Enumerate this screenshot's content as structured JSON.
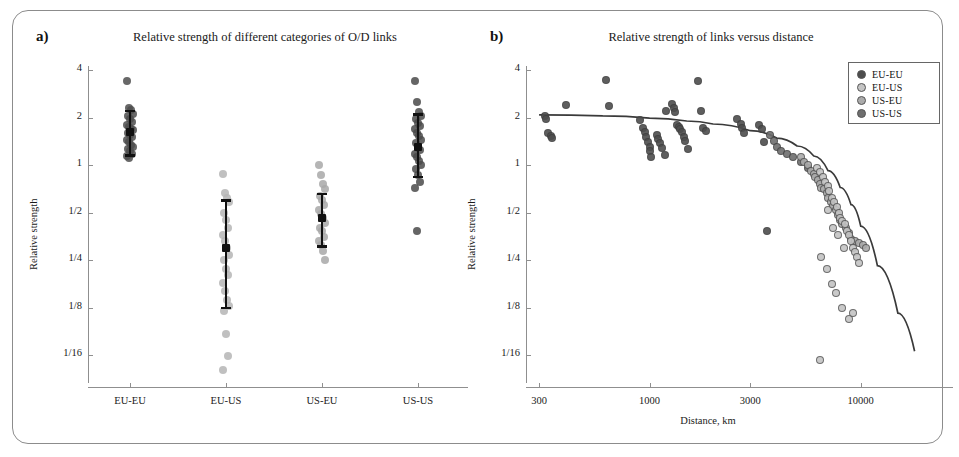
{
  "figure": {
    "panel_a_letter": "a)",
    "panel_b_letter": "b)"
  },
  "chart_data": [
    {
      "type": "scatter",
      "id": "panel-a",
      "title": "Relative strength of different categories of O/D links",
      "xlabel": "",
      "ylabel": "Relative strength",
      "yscale": "log2",
      "ylim": [
        0.045,
        4.6
      ],
      "ytick_values": [
        4,
        2,
        1,
        0.5,
        0.25,
        0.125,
        0.0625
      ],
      "ytick_labels": [
        "4",
        "2",
        "1",
        "1/2",
        "1/4",
        "1/8",
        "1/16"
      ],
      "categories": [
        "EU-EU",
        "EU-US",
        "US-EU",
        "US-US"
      ],
      "grid": false,
      "groups": [
        {
          "name": "EU-EU",
          "color": "#4d4d4d",
          "values": [
            3.4,
            2.3,
            2.22,
            2.1,
            2.05,
            1.95,
            1.86,
            1.8,
            1.75,
            1.7,
            1.66,
            1.6,
            1.56,
            1.5,
            1.45,
            1.4,
            1.34,
            1.3,
            1.26,
            1.22,
            1.18,
            1.14,
            1.1
          ],
          "mean": 1.62,
          "ci_low": 1.15,
          "ci_high": 2.2
        },
        {
          "name": "EU-US",
          "color": "#b5b5b5",
          "values": [
            0.88,
            0.66,
            0.62,
            0.58,
            0.5,
            0.45,
            0.4,
            0.36,
            0.33,
            0.3,
            0.27,
            0.25,
            0.22,
            0.2,
            0.18,
            0.16,
            0.14,
            0.127,
            0.118,
            0.085,
            0.062,
            0.05
          ],
          "mean": 0.3,
          "ci_low": 0.125,
          "ci_high": 0.6
        },
        {
          "name": "US-EU",
          "color": "#a8a8a8",
          "values": [
            1.0,
            0.86,
            0.76,
            0.7,
            0.64,
            0.6,
            0.56,
            0.52,
            0.49,
            0.46,
            0.43,
            0.4,
            0.38,
            0.35,
            0.33,
            0.31,
            0.285,
            0.25
          ],
          "mean": 0.46,
          "ci_low": 0.305,
          "ci_high": 0.655
        },
        {
          "name": "US-US",
          "color": "#4a4a4a",
          "values": [
            3.4,
            2.52,
            2.18,
            2.05,
            1.95,
            1.85,
            1.76,
            1.68,
            1.6,
            1.52,
            1.45,
            1.38,
            1.3,
            1.24,
            1.18,
            1.12,
            1.06,
            1.0,
            0.94,
            0.86,
            0.78,
            0.72,
            0.38
          ],
          "mean": 1.3,
          "ci_low": 0.84,
          "ci_high": 2.1
        }
      ]
    },
    {
      "type": "scatter",
      "id": "panel-b",
      "title": "Relative strength of links versus distance",
      "xlabel": "Distance, km",
      "ylabel": "Relative strength",
      "xscale": "log10",
      "yscale": "log2",
      "xlim": [
        260,
        22000
      ],
      "ylim": [
        0.045,
        4.6
      ],
      "xtick_values": [
        300,
        1000,
        3000,
        10000
      ],
      "xtick_labels": [
        "300",
        "1000",
        "3000",
        "10000"
      ],
      "ytick_values": [
        4,
        2,
        1,
        0.5,
        0.25,
        0.125,
        0.0625
      ],
      "ytick_labels": [
        "4",
        "2",
        "1",
        "1/2",
        "1/4",
        "1/8",
        "1/16"
      ],
      "grid": false,
      "legend_position": "top-right",
      "legend": [
        {
          "label": "EU-EU",
          "color": "#4d4d4d"
        },
        {
          "label": "EU-US",
          "color": "#c4c4c4"
        },
        {
          "label": "US-EU",
          "color": "#ababab"
        },
        {
          "label": "US-US",
          "color": "#6e6e6e"
        }
      ],
      "series": [
        {
          "name": "EU-EU",
          "color": "#4d4d4d",
          "points": [
            [
              320,
              2.05
            ],
            [
              325,
              1.95
            ],
            [
              330,
              1.6
            ],
            [
              340,
              1.52
            ],
            [
              345,
              1.48
            ],
            [
              400,
              2.4
            ],
            [
              620,
              3.45
            ],
            [
              640,
              2.38
            ],
            [
              900,
              1.92
            ],
            [
              930,
              1.72
            ],
            [
              950,
              1.62
            ],
            [
              960,
              1.5
            ],
            [
              980,
              1.4
            ],
            [
              1000,
              1.3
            ],
            [
              1010,
              1.22
            ],
            [
              1020,
              1.12
            ],
            [
              1080,
              1.55
            ],
            [
              1100,
              1.46
            ],
            [
              1120,
              1.38
            ],
            [
              1150,
              1.28
            ],
            [
              1180,
              1.16
            ],
            [
              1200,
              2.2
            ],
            [
              1280,
              2.42
            ],
            [
              1300,
              2.3
            ],
            [
              1320,
              2.18
            ],
            [
              1350,
              1.8
            ],
            [
              1380,
              1.74
            ],
            [
              1400,
              1.7
            ],
            [
              1420,
              1.62
            ],
            [
              1450,
              1.5
            ],
            [
              1470,
              1.42
            ],
            [
              1520,
              1.26
            ],
            [
              1700,
              3.4
            ],
            [
              1760,
              2.2
            ],
            [
              1800,
              1.72
            ],
            [
              1850,
              1.64
            ],
            [
              2600,
              1.95
            ],
            [
              2700,
              1.82
            ],
            [
              2750,
              1.72
            ],
            [
              2800,
              1.6
            ],
            [
              3300,
              1.78
            ],
            [
              3400,
              1.68
            ],
            [
              3500,
              1.4
            ],
            [
              3600,
              0.38
            ]
          ]
        },
        {
          "name": "US-US",
          "color": "#6e6e6e",
          "points": [
            [
              3700,
              1.55
            ],
            [
              3900,
              1.42
            ],
            [
              4000,
              1.3
            ],
            [
              4200,
              1.22
            ],
            [
              4500,
              1.18
            ],
            [
              4800,
              1.12
            ],
            [
              5200,
              1.05
            ],
            [
              5600,
              0.96
            ]
          ]
        },
        {
          "name": "US-EU",
          "color": "#ababab",
          "points": [
            [
              5200,
              1.12
            ],
            [
              5400,
              1.04
            ],
            [
              5600,
              1.0
            ],
            [
              5800,
              0.92
            ],
            [
              6000,
              0.88
            ],
            [
              6100,
              0.84
            ],
            [
              6300,
              0.8
            ],
            [
              6400,
              0.76
            ],
            [
              6500,
              0.72
            ],
            [
              6700,
              0.7
            ],
            [
              6900,
              0.66
            ],
            [
              7000,
              0.62
            ],
            [
              7200,
              0.58
            ],
            [
              7400,
              0.55
            ],
            [
              7600,
              0.52
            ],
            [
              7800,
              0.48
            ],
            [
              8000,
              0.45
            ],
            [
              8200,
              0.42
            ],
            [
              8500,
              0.4
            ],
            [
              8800,
              0.37
            ],
            [
              9000,
              0.34
            ],
            [
              9400,
              0.33
            ],
            [
              9800,
              0.32
            ],
            [
              10200,
              0.31
            ],
            [
              10600,
              0.3
            ]
          ]
        },
        {
          "name": "EU-US",
          "color": "#c4c4c4",
          "points": [
            [
              6200,
              0.96
            ],
            [
              6400,
              0.9
            ],
            [
              6600,
              0.84
            ],
            [
              6800,
              0.78
            ],
            [
              7000,
              0.74
            ],
            [
              7100,
              0.68
            ],
            [
              7300,
              0.62
            ],
            [
              7500,
              0.58
            ],
            [
              7700,
              0.54
            ],
            [
              7900,
              0.5
            ],
            [
              8000,
              0.46
            ],
            [
              8200,
              0.44
            ],
            [
              8400,
              0.42
            ],
            [
              8600,
              0.38
            ],
            [
              8800,
              0.36
            ],
            [
              9000,
              0.33
            ],
            [
              9200,
              0.3
            ],
            [
              9400,
              0.28
            ],
            [
              9600,
              0.26
            ],
            [
              9800,
              0.24
            ],
            [
              6500,
              0.26
            ],
            [
              6900,
              0.22
            ],
            [
              7300,
              0.175
            ],
            [
              7600,
              0.155
            ],
            [
              8200,
              0.125
            ],
            [
              8800,
              0.105
            ],
            [
              9200,
              0.115
            ],
            [
              6400,
              0.058
            ],
            [
              7000,
              0.52
            ],
            [
              7400,
              0.4
            ],
            [
              7800,
              0.36
            ],
            [
              8300,
              0.3
            ]
          ]
        }
      ],
      "fit_curve": {
        "description": "declining trend line",
        "points": [
          [
            300,
            2.08
          ],
          [
            600,
            2.05
          ],
          [
            1000,
            1.98
          ],
          [
            1500,
            1.9
          ],
          [
            2000,
            1.82
          ],
          [
            3000,
            1.65
          ],
          [
            4000,
            1.48
          ],
          [
            5000,
            1.32
          ],
          [
            6000,
            1.14
          ],
          [
            7000,
            0.92
          ],
          [
            8000,
            0.72
          ],
          [
            9000,
            0.56
          ],
          [
            10000,
            0.41
          ],
          [
            12000,
            0.23
          ],
          [
            15000,
            0.115
          ],
          [
            18000,
            0.066
          ]
        ]
      }
    }
  ]
}
